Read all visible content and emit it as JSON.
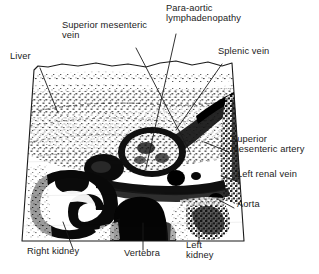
{
  "figure": {
    "kind": "annotated-ultrasound-scan",
    "modality": "Transverse abdominal ultrasound scan",
    "background_color": "#ffffff",
    "ink_color": "#1b1b1b",
    "scan_field": {
      "shape": "trapezoid with irregular upper skin-line edge",
      "left_edge_top_x": 34,
      "left_edge_bottom_x": 22,
      "right_edge_top_x": 232,
      "right_edge_bottom_x": 244,
      "top_y": 62,
      "bottom_y": 241
    }
  },
  "labels": [
    {
      "id": "liver",
      "text": "Liver",
      "x": 10,
      "y": 57,
      "align": "left",
      "leader": {
        "x1": 40,
        "y1": 68,
        "x2": 58,
        "y2": 113
      }
    },
    {
      "id": "superior-mesenteric-vein",
      "text": "Superior mesenteric\nvein",
      "x": 62,
      "y": 26,
      "align": "left",
      "leader": {
        "x1": 136,
        "y1": 48,
        "x2": 190,
        "y2": 152
      }
    },
    {
      "id": "para-aortic-lymphadenopathy",
      "text": "Para-aortic\nlymphadenopathy",
      "x": 166,
      "y": 9,
      "align": "left",
      "leader": {
        "x1": 176,
        "y1": 34,
        "x2": 146,
        "y2": 168
      }
    },
    {
      "id": "splenic-vein",
      "text": "Splenic vein",
      "x": 218,
      "y": 52,
      "align": "left",
      "leader": {
        "x1": 222,
        "y1": 64,
        "x2": 176,
        "y2": 130
      }
    },
    {
      "id": "superior-mesenteric-artery",
      "text": "Superior\nmesenteric artery",
      "x": 231,
      "y": 140,
      "align": "left",
      "leader": {
        "x1": 229,
        "y1": 152,
        "x2": 204,
        "y2": 142
      }
    },
    {
      "id": "left-renal-vein",
      "text": "Left renal vein",
      "x": 237,
      "y": 175,
      "align": "left",
      "leader": {
        "x1": 234,
        "y1": 180,
        "x2": 222,
        "y2": 176
      }
    },
    {
      "id": "aorta",
      "text": "Aorta",
      "x": 237,
      "y": 205,
      "align": "left",
      "leader": {
        "x1": 234,
        "y1": 208,
        "x2": 219,
        "y2": 200
      }
    },
    {
      "id": "right-kidney",
      "text": "Right kidney",
      "x": 27,
      "y": 252,
      "align": "left",
      "leader": {
        "x1": 73,
        "y1": 249,
        "x2": 63,
        "y2": 222
      }
    },
    {
      "id": "vertebra",
      "text": "Vertebra",
      "x": 124,
      "y": 254,
      "align": "left",
      "leader": {
        "x1": 143,
        "y1": 250,
        "x2": 143,
        "y2": 223
      }
    },
    {
      "id": "left-kidney",
      "text": "Left\nkidney",
      "x": 186,
      "y": 246,
      "align": "left",
      "leader": {
        "x1": 199,
        "y1": 243,
        "x2": 199,
        "y2": 222
      }
    }
  ],
  "anatomy_regions": [
    {
      "id": "liver-parenchyma",
      "description": "speckled homogeneous echo texture, left upper half"
    },
    {
      "id": "para-aortic-node-mass",
      "description": "rounded hypoechoic mass with bright rim, right of midline"
    },
    {
      "id": "splenic-vein-band",
      "description": "dark curvilinear band running obliquely to the right flank"
    },
    {
      "id": "superior-mesenteric-vessels",
      "description": "small round dark dots in midline anterior to aorta"
    },
    {
      "id": "aorta-lumen",
      "description": "dark round lumen just left of vertebra"
    },
    {
      "id": "left-renal-vein-band",
      "description": "thin dark band crossing midline toward left"
    },
    {
      "id": "right-kidney-mass",
      "description": "C-shaped dark cortex with echogenic central sinus, lower left"
    },
    {
      "id": "vertebral-body-shadow",
      "description": "broad dense black acoustic shadow at midline base"
    },
    {
      "id": "left-kidney-mass",
      "description": "speckled dark region at lower right"
    }
  ]
}
